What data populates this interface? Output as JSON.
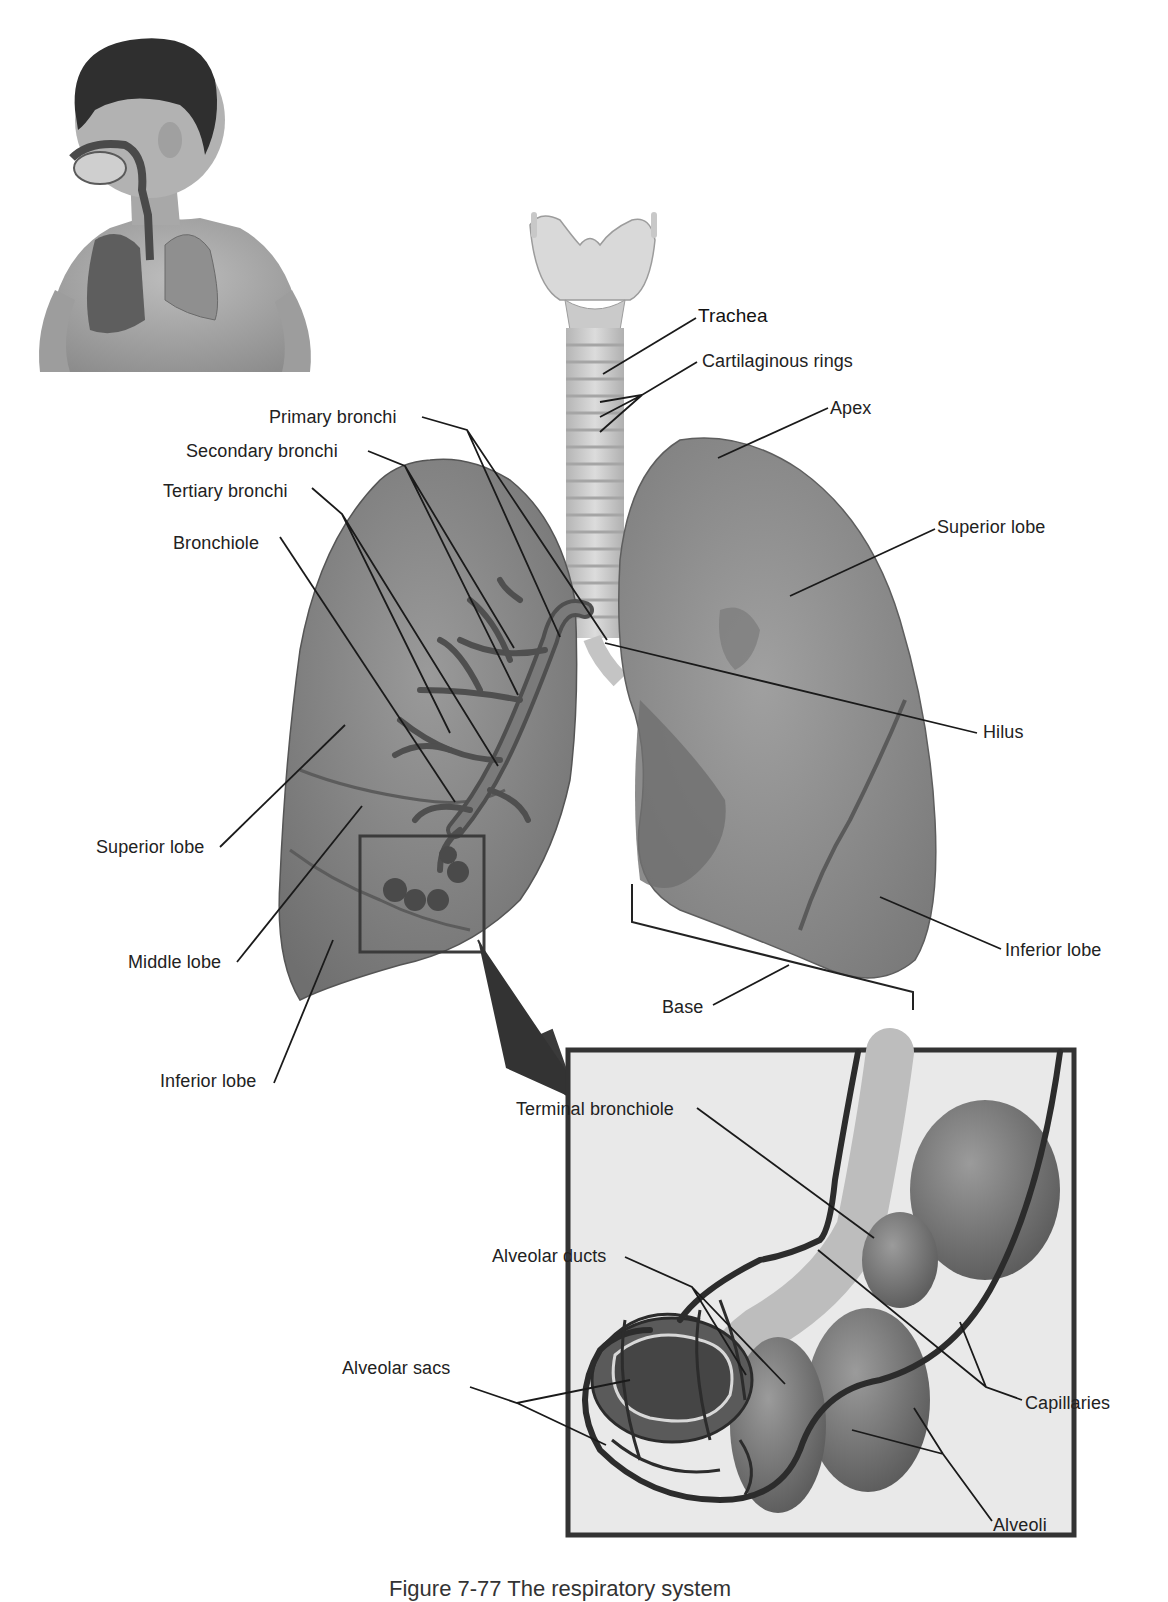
{
  "figure": {
    "caption": "Figure 7-77 The respiratory system",
    "colors": {
      "lung_fill": "#8a8a8a",
      "lung_dark": "#6e6e6e",
      "trachea_fill": "#cfcfcf",
      "inset_bg": "#e9e9e9",
      "leader_line": "#1a1a1a",
      "label_text": "#222222"
    }
  },
  "inset_child": {
    "description": "child-figure-with-respiratory-overlay"
  },
  "labels": {
    "trachea": "Trachea",
    "cartilaginous_rings": "Cartilaginous rings",
    "apex": "Apex",
    "primary_bronchi": "Primary bronchi",
    "secondary_bronchi": "Secondary bronchi",
    "tertiary_bronchi": "Tertiary bronchi",
    "bronchiole": "Bronchiole",
    "superior_lobe_right": "Superior lobe",
    "hilus": "Hilus",
    "superior_lobe_left": "Superior lobe",
    "middle_lobe": "Middle lobe",
    "inferior_lobe_left": "Inferior lobe",
    "inferior_lobe_right": "Inferior lobe",
    "base": "Base",
    "terminal_bronchiole": "Terminal bronchiole",
    "alveolar_ducts": "Alveolar ducts",
    "alveolar_sacs": "Alveolar sacs",
    "capillaries": "Capillaries",
    "alveoli": "Alveoli"
  }
}
